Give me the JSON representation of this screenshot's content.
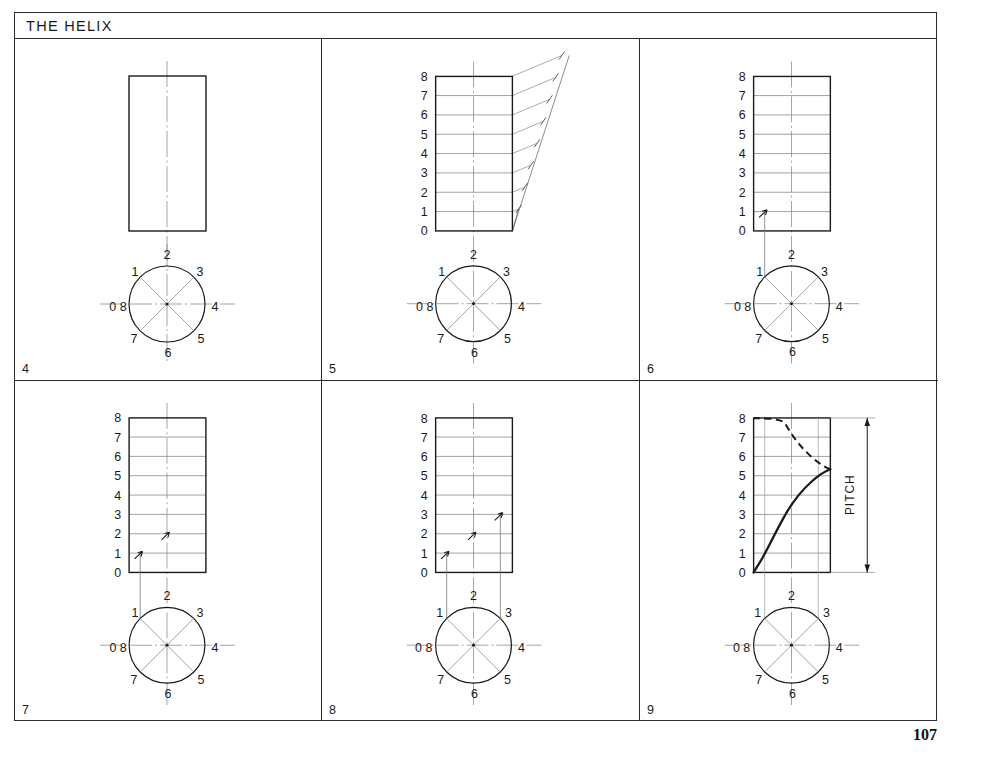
{
  "page": {
    "title": "THE HELIX",
    "page_number": "107",
    "colors": {
      "ink": "#1a1a1a",
      "border": "#2b2b2b",
      "construction_line": "#8a8a8a",
      "centre_line": "#9a9a9a",
      "object_line": "#1a1a1a"
    }
  },
  "panels": [
    {
      "id": "panel-4",
      "step_label": "4",
      "caption": "Rectangular elevation with vertical centre line and plan circle divided into eight equal sectors",
      "elevation": {
        "divisions_shown": false,
        "division_labels": []
      },
      "plan": {
        "labels": [
          "0 8",
          "1",
          "2",
          "3",
          "4",
          "5",
          "6",
          "7"
        ],
        "sector_count": 8
      },
      "projectors": [],
      "arrow_levels": [],
      "has_fan_construction": false,
      "has_helix_curve": false,
      "has_pitch_dimension": false
    },
    {
      "id": "panel-5",
      "step_label": "5",
      "caption": "Pitch divided into eight equal parts using an inclined construction line",
      "elevation": {
        "divisions_shown": true,
        "division_labels": [
          "0",
          "1",
          "2",
          "3",
          "4",
          "5",
          "6",
          "7",
          "8"
        ]
      },
      "plan": {
        "labels": [
          "0 8",
          "1",
          "2",
          "3",
          "4",
          "5",
          "6",
          "7"
        ],
        "sector_count": 8
      },
      "projectors": [],
      "arrow_levels": [],
      "has_fan_construction": true,
      "has_helix_curve": false,
      "has_pitch_dimension": false
    },
    {
      "id": "panel-6",
      "step_label": "6",
      "caption": "Point 1 of the plan projected up to division 1 of the elevation",
      "elevation": {
        "divisions_shown": true,
        "division_labels": [
          "0",
          "1",
          "2",
          "3",
          "4",
          "5",
          "6",
          "7",
          "8"
        ]
      },
      "plan": {
        "labels": [
          "0 8",
          "1",
          "2",
          "3",
          "4",
          "5",
          "6",
          "7"
        ],
        "sector_count": 8
      },
      "projectors": [
        "1"
      ],
      "arrow_levels": [
        "1"
      ],
      "has_fan_construction": false,
      "has_helix_curve": false,
      "has_pitch_dimension": false
    },
    {
      "id": "panel-7",
      "step_label": "7",
      "caption": "Second point located: projector from plan point 1 with arrows at divisions 1 and 2",
      "elevation": {
        "divisions_shown": true,
        "division_labels": [
          "0",
          "1",
          "2",
          "3",
          "4",
          "5",
          "6",
          "7",
          "8"
        ]
      },
      "plan": {
        "labels": [
          "0 8",
          "1",
          "2",
          "3",
          "4",
          "5",
          "6",
          "7"
        ],
        "sector_count": 8
      },
      "projectors": [
        "1"
      ],
      "arrow_levels": [
        "1",
        "2"
      ],
      "has_fan_construction": false,
      "has_helix_curve": false,
      "has_pitch_dimension": false
    },
    {
      "id": "panel-8",
      "step_label": "8",
      "caption": "Projectors from plan points 1 and 3 give further points at divisions 1, 2 and 3",
      "elevation": {
        "divisions_shown": true,
        "division_labels": [
          "0",
          "1",
          "2",
          "3",
          "4",
          "5",
          "6",
          "7",
          "8"
        ]
      },
      "plan": {
        "labels": [
          "0 8",
          "1",
          "2",
          "3",
          "4",
          "5",
          "6",
          "7"
        ],
        "sector_count": 8
      },
      "projectors": [
        "1",
        "3"
      ],
      "arrow_levels": [
        "1",
        "2",
        "3"
      ],
      "has_fan_construction": false,
      "has_helix_curve": false,
      "has_pitch_dimension": false
    },
    {
      "id": "panel-9",
      "step_label": "9",
      "caption": "Completed helix: solid where visible from 0 to 4, dashed where hidden from 4 to 8",
      "elevation": {
        "divisions_shown": true,
        "division_labels": [
          "0",
          "1",
          "2",
          "3",
          "4",
          "5",
          "6",
          "7",
          "8"
        ]
      },
      "plan": {
        "labels": [
          "0 8",
          "1",
          "2",
          "3",
          "4",
          "5",
          "6",
          "7"
        ],
        "sector_count": 8
      },
      "projectors": [
        "1",
        "3"
      ],
      "arrow_levels": [],
      "has_fan_construction": false,
      "has_helix_curve": true,
      "has_pitch_dimension": true,
      "dimension": {
        "label": "PITCH",
        "from_division": "0",
        "to_division": "8",
        "orientation": "vertical"
      },
      "helix": {
        "visible_from": "0",
        "visible_to": "4",
        "hidden_from": "4",
        "hidden_to": "8"
      }
    }
  ]
}
